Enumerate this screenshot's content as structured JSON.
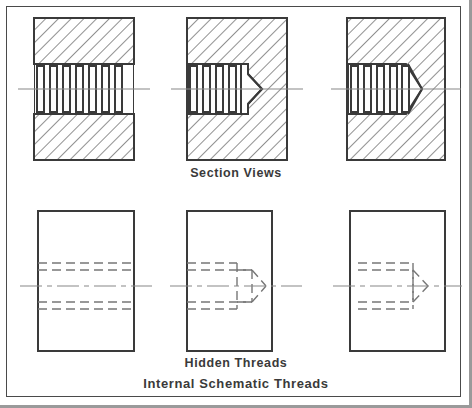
{
  "drawing": {
    "title": "Internal Schematic Threads",
    "captions": {
      "section_views": "Section Views",
      "hidden_threads": "Hidden Threads",
      "internal_schematic_threads": "Internal Schematic Threads"
    },
    "colors": {
      "line": "#3a3a3a",
      "hatch": "#555555",
      "hidden_line": "#777777",
      "center_line": "#888888",
      "page_border": "#4a4a4a",
      "page_shadow": "#9a9a9a",
      "background": "#ffffff"
    },
    "top_row": {
      "label": "section-views-row",
      "views": [
        {
          "name": "through-hole-section",
          "rect": {
            "x": 34,
            "y": 18,
            "w": 100,
            "h": 142
          },
          "thread_zone": {
            "x": 34,
            "y": 64,
            "w": 100,
            "h": 50
          },
          "teeth": 7,
          "end_type": "through",
          "centerline_y": 89
        },
        {
          "name": "blind-hole-chamfer-section",
          "rect": {
            "x": 187,
            "y": 18,
            "w": 100,
            "h": 142
          },
          "thread_zone": {
            "x": 187,
            "y": 64,
            "w": 60,
            "h": 50
          },
          "teeth": 4,
          "end_type": "flat-bottom-with-cone",
          "centerline_y": 89
        },
        {
          "name": "blind-hole-cone-section",
          "rect": {
            "x": 347,
            "y": 18,
            "w": 98,
            "h": 142
          },
          "thread_zone": {
            "x": 347,
            "y": 64,
            "w": 73,
            "h": 50
          },
          "teeth": 5,
          "end_type": "cone",
          "centerline_y": 89
        }
      ]
    },
    "bottom_row": {
      "label": "hidden-threads-row",
      "views": [
        {
          "name": "through-hole-hidden",
          "rect": {
            "x": 38,
            "y": 211,
            "w": 96,
            "h": 140
          },
          "end_type": "through",
          "centerline_y": 286
        },
        {
          "name": "blind-hole-chamfer-hidden",
          "rect": {
            "x": 187,
            "y": 211,
            "w": 85,
            "h": 140
          },
          "end_type": "flat-bottom-with-cone",
          "centerline_y": 286
        },
        {
          "name": "blind-hole-cone-hidden",
          "rect": {
            "x": 350,
            "y": 211,
            "w": 95,
            "h": 140
          },
          "end_type": "cone",
          "centerline_y": 286
        }
      ]
    }
  }
}
